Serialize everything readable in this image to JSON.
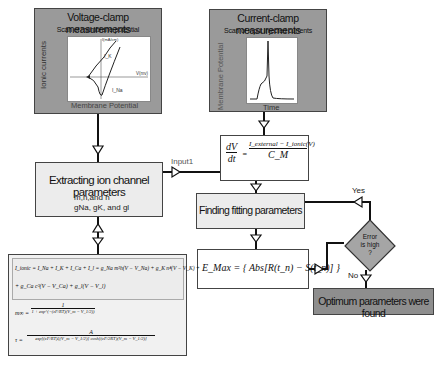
{
  "voltage_clamp": {
    "title": "Voltage-clamp measurements",
    "subtitle": "Scan of membrane potential",
    "y_label": "Ionic currents",
    "x_label": "Membrane Potential",
    "plot_y_axis": "I(mA/cm)",
    "plot_x_axis": "V(mv)",
    "curve_k": "I_K",
    "curve_na": "I_Na"
  },
  "current_clamp": {
    "title": "Current-clamp measurements",
    "subtitle": "Scan of input injected currents",
    "y_label": "Membrane Potential",
    "x_label": "Time"
  },
  "membrane_equation": {
    "lhs_num": "dV",
    "lhs_den": "dt",
    "rhs_num": "I_external − I_ionic(V)",
    "rhs_den": "C_M"
  },
  "extracting": {
    "title": "Extracting ion channel parameters",
    "line1": "m,n,and h",
    "line2": "gNa, gK, and gl"
  },
  "input_label": "Input1",
  "finding": {
    "title": "Finding fitting parameters"
  },
  "emax": {
    "equation": "E_Max = { Abs[R(t_n) − S(t_n)] }"
  },
  "decision": {
    "line1": "Error",
    "line2": "is high",
    "line3": "?",
    "yes": "Yes",
    "no": "No"
  },
  "optimum": {
    "title": "Optimum parameters were found"
  },
  "equations": {
    "ionic_line1": "I_ionic = I_Na + I_K + I_Ca + I_l = g_Na m³h(V − V_Na) + g_K n⁴(V − V_K) +",
    "ionic_line2": "+ g_Ca c³(V − V_Ca) + g_l(V − V_l)",
    "m_inf_lhs": "m∞ =",
    "m_inf_num": "1",
    "m_inf_den": "1 + exp^(−(zF/RT)(V_m − V_1/2))",
    "tau_lhs": "τ =",
    "tau_num": "A",
    "tau_den": "exp[(zF/RT)ξ(V_m − V_1/2)] cosh[(zF/2RT)(V_m − V_1/2)]"
  },
  "colors": {
    "dark_box": "#9a9a9a",
    "light_box": "#ececec",
    "line": "#111111"
  }
}
